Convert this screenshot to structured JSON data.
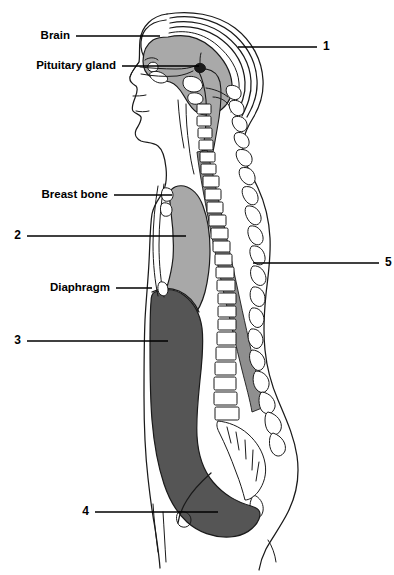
{
  "figure": {
    "width": 394,
    "height": 575,
    "background": "#ffffff"
  },
  "palette": {
    "ink": "#1a1a1a",
    "paper": "#ffffff",
    "brain_gray": "#a9a9a9",
    "thoracic_gray": "#a8a8a8",
    "abdominal_gray": "#555555",
    "cord_gray": "#8f8f8f",
    "bone_white": "#ffffff"
  },
  "labels": {
    "brain": {
      "text": "Brain",
      "x": 70,
      "y": 36,
      "anchor": "end",
      "leader": "M 76 36 L 160 36",
      "target": "brain-mass"
    },
    "pituitary": {
      "text": "Pituitary gland",
      "x": 116,
      "y": 66,
      "anchor": "end",
      "leader": "M 122 66 L 199 66",
      "target": "pituitary-gland"
    },
    "breast_bone": {
      "text": "Breast bone",
      "x": 108,
      "y": 195,
      "anchor": "end",
      "leader": "M 114 195 L 172 195",
      "target": "sternum"
    },
    "diaphragm": {
      "text": "Diaphragm",
      "x": 110,
      "y": 288,
      "anchor": "end",
      "leader": "M 116 288 L 152 288",
      "target": "diaphragm-line"
    },
    "num1": {
      "text": "1",
      "x": 323,
      "y": 47,
      "anchor": "start",
      "leader": "M 238 47 L 317 47",
      "target": "cranium-skull"
    },
    "num2": {
      "text": "2",
      "x": 21,
      "y": 236,
      "anchor": "end",
      "leader": "M 27 236 L 186 236",
      "target": "thoracic-cavity"
    },
    "num3": {
      "text": "3",
      "x": 21,
      "y": 341,
      "anchor": "end",
      "leader": "M 27 341 L 168 341",
      "target": "abdominal-cavity"
    },
    "num4": {
      "text": "4",
      "x": 89,
      "y": 512,
      "anchor": "end",
      "leader": "M 95 512 L 218 512",
      "target": "pelvic-region"
    },
    "num5": {
      "text": "5",
      "x": 385,
      "y": 263,
      "anchor": "start",
      "leader": "M 253 263 L 379 263",
      "target": "spinal-cord"
    }
  },
  "structures": {
    "brain_mass": "brain",
    "pituitary_gland": "pituitary gland",
    "cranium": "cranium / skull vault",
    "sternum": "breast bone (sternum)",
    "diaphragm": "diaphragm",
    "thoracic_cavity": "thoracic cavity",
    "abdominal_cavity": "abdominal cavity",
    "pelvic_region": "pelvic region",
    "vertebral_column": "vertebral column",
    "spinal_cord": "spinal cord",
    "body_outline": "body profile outline",
    "face_profile": "face profile",
    "sacrum": "sacrum and coccyx"
  }
}
